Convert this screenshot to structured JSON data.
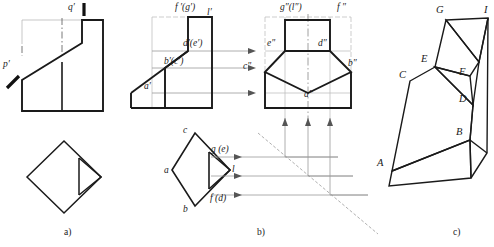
{
  "figure": {
    "kind": "engineering-drawing",
    "colors": {
      "outline": "#1a1a1a",
      "thin": "#7a7a7a",
      "construction": "#a8a8a8",
      "background": "#ffffff"
    }
  },
  "panels": [
    {
      "id": "a",
      "caption": "a)",
      "caption_x": 64,
      "caption_y": 231
    },
    {
      "id": "b",
      "caption": "b)",
      "caption_x": 257,
      "caption_y": 231
    },
    {
      "id": "c",
      "caption": "c)",
      "caption_x": 455,
      "caption_y": 231
    }
  ],
  "panel_a": {
    "labels": [
      {
        "name": "label-q-prime",
        "text": "q′",
        "x": 68,
        "y": 3
      },
      {
        "name": "label-p-prime",
        "text": "p′",
        "x": 3,
        "y": 60
      }
    ]
  },
  "panel_b": {
    "front_view_labels": [
      {
        "name": "label-f-prime-g-prime",
        "text": "f ′(g′)",
        "x": 175,
        "y": 4
      },
      {
        "name": "label-l-prime",
        "text": "l′",
        "x": 206,
        "y": 8
      },
      {
        "name": "label-d-prime-e-prime",
        "text": "d′(e′)",
        "x": 184,
        "y": 40
      },
      {
        "name": "label-b-prime-c-prime",
        "text": "b′(c′)",
        "x": 166,
        "y": 59
      },
      {
        "name": "label-a-prime",
        "text": "a′",
        "x": 145,
        "y": 82
      }
    ],
    "side_view_labels": [
      {
        "name": "label-g-double-prime-l-double-prime",
        "text": "g″(l″)",
        "x": 280,
        "y": 4
      },
      {
        "name": "label-f-double-prime",
        "text": "f ″",
        "x": 337,
        "y": 4
      },
      {
        "name": "label-e-double-prime",
        "text": "e″",
        "x": 268,
        "y": 40
      },
      {
        "name": "label-d-double-prime",
        "text": "d″",
        "x": 319,
        "y": 40
      },
      {
        "name": "label-c-double-prime",
        "text": "c″",
        "x": 244,
        "y": 62
      },
      {
        "name": "label-b-double-prime",
        "text": "b″",
        "x": 348,
        "y": 60
      },
      {
        "name": "label-a-double-prime",
        "text": "a″",
        "x": 305,
        "y": 90
      }
    ],
    "top_view_labels": [
      {
        "name": "label-c",
        "text": "c",
        "x": 183,
        "y": 129
      },
      {
        "name": "label-a",
        "text": "a",
        "x": 166,
        "y": 168
      },
      {
        "name": "label-g-e",
        "text": "g (e)",
        "x": 212,
        "y": 147
      },
      {
        "name": "label-l",
        "text": "l",
        "x": 233,
        "y": 168
      },
      {
        "name": "label-f-d",
        "text": "f (d)",
        "x": 212,
        "y": 196
      },
      {
        "name": "label-b",
        "text": "b",
        "x": 183,
        "y": 207
      }
    ]
  },
  "panel_c": {
    "labels": [
      {
        "name": "label-G",
        "text": "G",
        "x": 436,
        "y": 7
      },
      {
        "name": "label-I",
        "text": "I",
        "x": 483,
        "y": 6
      },
      {
        "name": "label-E",
        "text": "E",
        "x": 422,
        "y": 58
      },
      {
        "name": "label-F",
        "text": "F",
        "x": 459,
        "y": 70
      },
      {
        "name": "label-C",
        "text": "C",
        "x": 401,
        "y": 74
      },
      {
        "name": "label-D",
        "text": "D",
        "x": 460,
        "y": 96
      },
      {
        "name": "label-B",
        "text": "B",
        "x": 457,
        "y": 130
      },
      {
        "name": "label-A",
        "text": "A",
        "x": 378,
        "y": 160
      }
    ]
  }
}
